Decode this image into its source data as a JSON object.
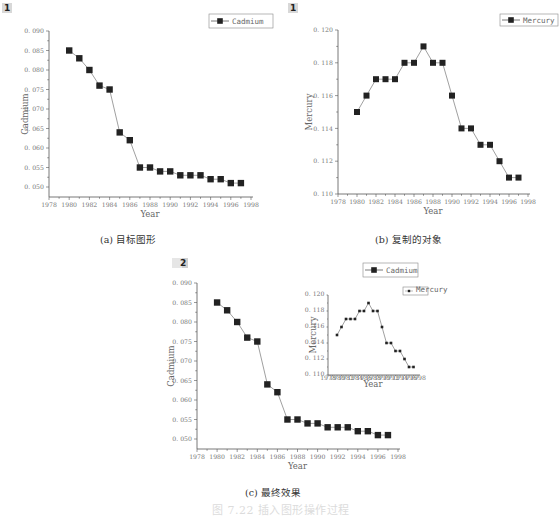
{
  "markers": {
    "a": "1",
    "b": "1",
    "c": "2"
  },
  "captions": {
    "a": "(a) 目标图形",
    "b": "(b) 复制的对象",
    "c": "(c) 最终效果",
    "figure": "图 7.22   插入图形操作过程"
  },
  "chart_data": [
    {
      "id": "a",
      "type": "line",
      "title": "",
      "xlabel": "Year",
      "ylabel": "Cadmium",
      "legend": [
        "Cadmium"
      ],
      "legend_position": "top-right",
      "grid": false,
      "xlim": [
        1978,
        1998
      ],
      "ylim": [
        0.048,
        0.09
      ],
      "x_ticks": [
        "1978",
        "1980",
        "1982",
        "1984",
        "1986",
        "1988",
        "1990",
        "1992",
        "1994",
        "1996",
        "1998"
      ],
      "y_ticks": [
        "0.090",
        "0.085",
        "0.080",
        "0.075",
        "0.070",
        "0.065",
        "0.060",
        "0.055",
        "0.050"
      ],
      "x": [
        1980,
        1981,
        1982,
        1983,
        1984,
        1985,
        1986,
        1987,
        1988,
        1989,
        1990,
        1991,
        1992,
        1993,
        1994,
        1995,
        1996,
        1997
      ],
      "series": [
        {
          "name": "Cadmium",
          "values": [
            0.085,
            0.083,
            0.08,
            0.076,
            0.075,
            0.064,
            0.062,
            0.055,
            0.055,
            0.054,
            0.054,
            0.053,
            0.053,
            0.053,
            0.052,
            0.052,
            0.051,
            0.051
          ]
        }
      ]
    },
    {
      "id": "b",
      "type": "line",
      "title": "",
      "xlabel": "Year",
      "ylabel": "Mercury",
      "legend": [
        "Mercury"
      ],
      "legend_position": "top-right",
      "grid": false,
      "xlim": [
        1978,
        1998
      ],
      "ylim": [
        0.11,
        0.12
      ],
      "x_ticks": [
        "1978",
        "1980",
        "1982",
        "1984",
        "1986",
        "1988",
        "1990",
        "1992",
        "1994",
        "1996",
        "1998"
      ],
      "y_ticks": [
        "0.120",
        "0.118",
        "0.116",
        "0.114",
        "0.112",
        "0.110"
      ],
      "x": [
        1980,
        1981,
        1982,
        1983,
        1984,
        1985,
        1986,
        1987,
        1988,
        1989,
        1990,
        1991,
        1992,
        1993,
        1994,
        1995,
        1996,
        1997
      ],
      "series": [
        {
          "name": "Mercury",
          "values": [
            0.115,
            0.116,
            0.117,
            0.117,
            0.117,
            0.118,
            0.118,
            0.119,
            0.118,
            0.118,
            0.116,
            0.114,
            0.114,
            0.113,
            0.113,
            0.112,
            0.111,
            0.111
          ]
        }
      ]
    },
    {
      "id": "c",
      "type": "line",
      "title": "",
      "xlabel": "Year",
      "ylabel": "Cadmium",
      "legend": [
        "Cadmium"
      ],
      "legend_position": "top-right",
      "grid": false,
      "xlim": [
        1978,
        1998
      ],
      "ylim": [
        0.048,
        0.09
      ],
      "x_ticks": [
        "1978",
        "1980",
        "1982",
        "1984",
        "1986",
        "1988",
        "1990",
        "1992",
        "1994",
        "1996",
        "1998"
      ],
      "y_ticks": [
        "0.090",
        "0.085",
        "0.080",
        "0.075",
        "0.070",
        "0.065",
        "0.060",
        "0.055",
        "0.050"
      ],
      "x": [
        1980,
        1981,
        1982,
        1983,
        1984,
        1985,
        1986,
        1987,
        1988,
        1989,
        1990,
        1991,
        1992,
        1993,
        1994,
        1995,
        1996,
        1997
      ],
      "series": [
        {
          "name": "Cadmium",
          "values": [
            0.085,
            0.083,
            0.08,
            0.076,
            0.075,
            0.064,
            0.062,
            0.055,
            0.055,
            0.054,
            0.054,
            0.053,
            0.053,
            0.053,
            0.052,
            0.052,
            0.051,
            0.051
          ]
        }
      ],
      "inset": {
        "type": "line",
        "xlabel": "Year",
        "ylabel": "Mercury",
        "legend": [
          "Mercury"
        ],
        "xlim": [
          1978,
          1998
        ],
        "ylim": [
          0.11,
          0.12
        ],
        "x_ticks": [
          "1978",
          "1980",
          "1982",
          "1984",
          "1986",
          "1988",
          "1990",
          "1992",
          "1994",
          "1996",
          "1998"
        ],
        "y_ticks": [
          "0.120",
          "0.118",
          "0.116",
          "0.114",
          "0.112",
          "0.110"
        ],
        "x": [
          1980,
          1981,
          1982,
          1983,
          1984,
          1985,
          1986,
          1987,
          1988,
          1989,
          1990,
          1991,
          1992,
          1993,
          1994,
          1995,
          1996,
          1997
        ],
        "series": [
          {
            "name": "Mercury",
            "values": [
              0.115,
              0.116,
              0.117,
              0.117,
              0.117,
              0.118,
              0.118,
              0.119,
              0.118,
              0.118,
              0.116,
              0.114,
              0.114,
              0.113,
              0.113,
              0.112,
              0.111,
              0.111
            ]
          }
        ]
      }
    }
  ]
}
